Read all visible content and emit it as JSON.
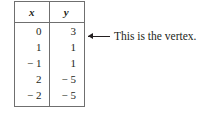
{
  "table": {
    "headers": [
      "x",
      "y"
    ],
    "rows": [
      {
        "x": "0",
        "y": "3"
      },
      {
        "x": "1",
        "y": "1"
      },
      {
        "x": "− 1",
        "y": "1"
      },
      {
        "x": "2",
        "y": "− 5"
      },
      {
        "x": "− 2",
        "y": "− 5"
      }
    ]
  },
  "annotation": {
    "icon": "left-arrow-icon",
    "text": "This is the vertex."
  },
  "colors": {
    "background": "#ffffff",
    "text": "#231f20",
    "rule": "#6f6f6f"
  }
}
